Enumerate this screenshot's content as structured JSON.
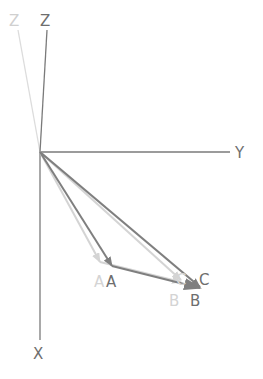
{
  "diagram": {
    "axes": {
      "x_label": "X",
      "y_label": "Y",
      "z_label": "Z",
      "z_label_ghost": "Z"
    },
    "points_current": {
      "a": "A",
      "b": "B",
      "c": "C"
    },
    "points_previous": {
      "a": "A",
      "b": "B",
      "c": "C"
    },
    "colors": {
      "axis": "#7a7a7a",
      "vector_current": "#7f7f7f",
      "vector_previous": "#d4d4d4"
    }
  }
}
